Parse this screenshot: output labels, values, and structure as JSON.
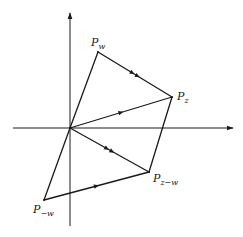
{
  "diagram": {
    "type": "complex-plane-vector-diagram",
    "stroke_color": "#1a1a1a",
    "background": "#ffffff",
    "axes": {
      "origin": [
        70,
        128
      ],
      "horizontal": {
        "from": [
          13,
          128
        ],
        "to": [
          233,
          128
        ],
        "arrow": "right"
      },
      "vertical": {
        "from": [
          70,
          226
        ],
        "to": [
          70,
          13
        ],
        "arrow": "up"
      }
    },
    "points": {
      "P_w": {
        "base": "P",
        "sub": "w",
        "x": 98,
        "y": 52,
        "label_x": 91,
        "label_y": 37
      },
      "P_z": {
        "base": "P",
        "sub": "z",
        "x": 172,
        "y": 97,
        "label_x": 177,
        "label_y": 91
      },
      "P_z_minus_w": {
        "base": "P",
        "sub": "z−w",
        "x": 149,
        "y": 172,
        "label_x": 153,
        "label_y": 173
      },
      "P_minus_w": {
        "base": "P",
        "sub": "−w",
        "x": 44,
        "y": 200,
        "label_x": 33,
        "label_y": 204
      }
    },
    "segments": [
      {
        "name": "origin-to-pw",
        "from": "origin",
        "to": "P_w",
        "arrows": 0
      },
      {
        "name": "pw-to-pz",
        "from": "P_w",
        "to": "P_z",
        "arrows": 2
      },
      {
        "name": "origin-to-pz",
        "from": "origin",
        "to": "P_z",
        "arrows": 1
      },
      {
        "name": "pz-to-pzmw",
        "from": "P_z",
        "to": "P_z_minus_w",
        "arrows": 0
      },
      {
        "name": "origin-to-pzmw",
        "from": "origin",
        "to": "P_z_minus_w",
        "arrows": 2
      },
      {
        "name": "pmw-to-pzmw",
        "from": "P_minus_w",
        "to": "P_z_minus_w",
        "arrows": 1
      },
      {
        "name": "origin-to-pmw",
        "from": "origin",
        "to": "P_minus_w",
        "arrows": 0
      }
    ]
  }
}
